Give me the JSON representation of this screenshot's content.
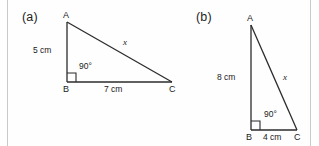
{
  "page": {
    "background_color": "#fefefe",
    "stroke_color": "#2b2b2b",
    "rule_color": "#c9c9c9",
    "width": 319,
    "height": 146
  },
  "figures": [
    {
      "id": "a",
      "caption": "(a)",
      "orientation": "right angle at B, horizontal base BC, vertical leg AB",
      "vertices": [
        {
          "name": "A",
          "label": "A",
          "x": 67,
          "y": 22
        },
        {
          "name": "B",
          "label": "B",
          "x": 67,
          "y": 82
        },
        {
          "name": "C",
          "label": "C",
          "x": 172,
          "y": 82
        }
      ],
      "sides": [
        {
          "name": "AB",
          "label": "5 cm",
          "value": 5,
          "unit": "cm",
          "known": true
        },
        {
          "name": "BC",
          "label": "7 cm",
          "value": 7,
          "unit": "cm",
          "known": true
        },
        {
          "name": "AC",
          "label": "x",
          "value": null,
          "unit": "cm",
          "known": false
        }
      ],
      "angle": {
        "at": "B",
        "label": "90°",
        "value": 90,
        "unit": "degrees",
        "marker": "right-angle-square"
      }
    },
    {
      "id": "b",
      "caption": "(b)",
      "orientation": "right angle at B, horizontal base BC, vertical leg AB",
      "vertices": [
        {
          "name": "A",
          "label": "A",
          "x": 251,
          "y": 25
        },
        {
          "name": "B",
          "label": "B",
          "x": 251,
          "y": 130
        },
        {
          "name": "C",
          "label": "C",
          "x": 297,
          "y": 130
        }
      ],
      "sides": [
        {
          "name": "AB",
          "label": "8 cm",
          "value": 8,
          "unit": "cm",
          "known": true
        },
        {
          "name": "BC",
          "label": "4 cm",
          "value": 4,
          "unit": "cm",
          "known": true
        },
        {
          "name": "AC",
          "label": "x",
          "value": null,
          "unit": "cm",
          "known": false
        }
      ],
      "angle": {
        "at": "B",
        "label": "90°",
        "value": 90,
        "unit": "degrees",
        "marker": "right-angle-square"
      }
    }
  ]
}
